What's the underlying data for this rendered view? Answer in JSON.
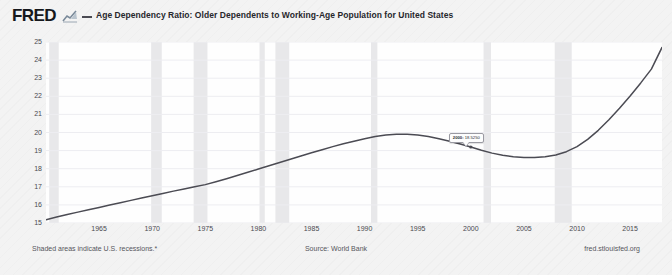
{
  "header": {
    "logo_text": "FRED",
    "logo_mark_icon": "mini-line-chart-icon",
    "legend_swatch_icon": "legend-line-icon",
    "series_title": "Age Dependency Ratio: Older Dependents to Working-Age Population for United States"
  },
  "footer": {
    "recession_note": "Shaded areas indicate U.S. recessions.*",
    "source": "Source: World Bank",
    "site": "fred.stlouisfed.org"
  },
  "tooltip": {
    "date": "2000:",
    "value": "18.5250"
  },
  "colors": {
    "line": "#4b4b53",
    "plot_background": "#fefefe",
    "page_background": "#f3f3f3",
    "recession_band": "#e8e8ea",
    "gridline": "#ededf1",
    "text": "#4a4a50"
  },
  "chart_data": {
    "type": "line",
    "title": "Age Dependency Ratio: Older Dependents to Working-Age Population for United States",
    "xlabel": "",
    "ylabel": "Percent of Working-Age Population",
    "xlim": [
      1960,
      2018
    ],
    "ylim": [
      15,
      25
    ],
    "yticks": [
      15,
      16,
      17,
      18,
      19,
      20,
      21,
      22,
      23,
      24,
      25
    ],
    "xticks": [
      1965,
      1970,
      1975,
      1980,
      1985,
      1990,
      1995,
      2000,
      2005,
      2010,
      2015
    ],
    "grid": true,
    "legend_position": "top",
    "series": [
      {
        "name": "Age Dependency Ratio: Older Dependents to Working-Age Population for United States",
        "x": [
          1960,
          1961,
          1962,
          1963,
          1964,
          1965,
          1966,
          1967,
          1968,
          1969,
          1970,
          1971,
          1972,
          1973,
          1974,
          1975,
          1976,
          1977,
          1978,
          1979,
          1980,
          1981,
          1982,
          1983,
          1984,
          1985,
          1986,
          1987,
          1988,
          1989,
          1990,
          1991,
          1992,
          1993,
          1994,
          1995,
          1996,
          1997,
          1998,
          1999,
          2000,
          2001,
          2002,
          2003,
          2004,
          2005,
          2006,
          2007,
          2008,
          2009,
          2010,
          2011,
          2012,
          2013,
          2014,
          2015,
          2016,
          2017,
          2018
        ],
        "y": [
          15.18,
          15.33,
          15.47,
          15.6,
          15.73,
          15.86,
          15.99,
          16.12,
          16.25,
          16.38,
          16.5,
          16.63,
          16.76,
          16.88,
          17.0,
          17.12,
          17.28,
          17.45,
          17.62,
          17.8,
          17.98,
          18.16,
          18.34,
          18.52,
          18.7,
          18.88,
          19.05,
          19.22,
          19.38,
          19.52,
          19.66,
          19.78,
          19.86,
          19.9,
          19.9,
          19.86,
          19.78,
          19.66,
          19.52,
          19.36,
          19.2,
          19.02,
          18.86,
          18.74,
          18.66,
          18.62,
          18.62,
          18.66,
          18.76,
          18.94,
          19.22,
          19.62,
          20.12,
          20.7,
          21.34,
          22.02,
          22.74,
          23.5,
          24.7
        ]
      }
    ],
    "recessions": [
      {
        "start": 1960.3,
        "end": 1961.2
      },
      {
        "start": 1969.9,
        "end": 1970.9
      },
      {
        "start": 1973.9,
        "end": 1975.2
      },
      {
        "start": 1980.1,
        "end": 1980.6
      },
      {
        "start": 1981.6,
        "end": 1982.9
      },
      {
        "start": 1990.6,
        "end": 1991.2
      },
      {
        "start": 2001.2,
        "end": 2001.9
      },
      {
        "start": 2007.9,
        "end": 2009.5
      }
    ],
    "annotation": {
      "x": 2000,
      "y": 19.2,
      "date_label": "2000:",
      "value_label": "18.5250"
    }
  }
}
